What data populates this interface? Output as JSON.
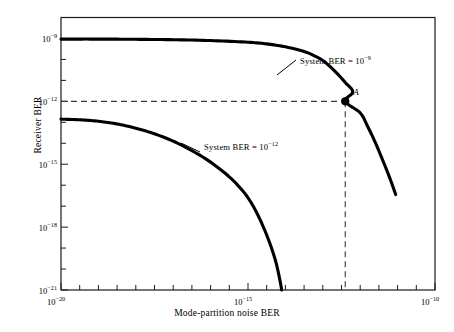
{
  "chart_data": {
    "type": "line",
    "title": "",
    "xlabel": "Mode-partition noise BER",
    "ylabel": "Receiver BER",
    "xscale": "log",
    "yscale": "log",
    "xlim": [
      1e-20,
      1e-10
    ],
    "ylim": [
      1e-21,
      1e-08
    ],
    "xticks": [
      "10^-20",
      "10^-15",
      "10^-10"
    ],
    "xtick_labels": [
      "10⁻²⁰",
      "10⁻¹⁵",
      "10⁻¹⁰"
    ],
    "xtick_values": [
      -20,
      -15,
      -10
    ],
    "yticks": [
      "10^-9",
      "10^-12",
      "10^-15",
      "10^-18",
      "10^-21"
    ],
    "ytick_labels": [
      "10⁻⁹",
      "10⁻¹²",
      "10⁻¹⁵",
      "10⁻¹⁸",
      "10⁻²¹"
    ],
    "ytick_values": [
      -9,
      -12,
      -15,
      -18,
      -21
    ],
    "grid": false,
    "legend": "none",
    "series": [
      {
        "name": "System BER = 10^-9",
        "label_text": "System BER  =  10",
        "label_exp": "−9",
        "style": "solid-thick",
        "points_log": [
          [
            -20.0,
            -9.03
          ],
          [
            -19.0,
            -9.03
          ],
          [
            -18.0,
            -9.04
          ],
          [
            -17.0,
            -9.06
          ],
          [
            -16.0,
            -9.1
          ],
          [
            -15.0,
            -9.18
          ],
          [
            -14.5,
            -9.26
          ],
          [
            -14.0,
            -9.4
          ],
          [
            -13.5,
            -9.62
          ],
          [
            -13.2,
            -9.85
          ],
          [
            -13.0,
            -10.05
          ],
          [
            -12.8,
            -10.35
          ],
          [
            -12.6,
            -10.7
          ],
          [
            -12.4,
            -11.1
          ],
          [
            -12.2,
            -11.55
          ],
          [
            -12.4,
            -12.0
          ],
          [
            -12.0,
            -12.55
          ],
          [
            -11.8,
            -13.2
          ],
          [
            -11.6,
            -13.95
          ],
          [
            -11.4,
            -14.8
          ],
          [
            -11.2,
            -15.7
          ],
          [
            -11.05,
            -16.45
          ]
        ]
      },
      {
        "name": "System BER = 10^-12",
        "label_text": "System BER  =  10",
        "label_exp": "−12",
        "style": "solid-thick",
        "points_log": [
          [
            -20.0,
            -12.85
          ],
          [
            -19.5,
            -12.88
          ],
          [
            -19.0,
            -12.95
          ],
          [
            -18.5,
            -13.08
          ],
          [
            -18.0,
            -13.28
          ],
          [
            -17.5,
            -13.55
          ],
          [
            -17.0,
            -13.9
          ],
          [
            -16.5,
            -14.35
          ],
          [
            -16.0,
            -14.9
          ],
          [
            -15.5,
            -15.6
          ],
          [
            -15.2,
            -16.15
          ],
          [
            -15.0,
            -16.6
          ],
          [
            -14.8,
            -17.2
          ],
          [
            -14.6,
            -17.95
          ],
          [
            -14.4,
            -18.85
          ],
          [
            -14.25,
            -19.7
          ],
          [
            -14.15,
            -20.5
          ],
          [
            -14.1,
            -21.0
          ]
        ]
      }
    ],
    "annotations": [
      {
        "name": "point-a",
        "label": "A",
        "x_log": -12.4,
        "y_log": -12.0,
        "marker": "filled-circle",
        "guide_lines": "dashed horizontal to y-axis, dashed vertical to x-axis"
      }
    ]
  },
  "axis": {
    "xlabel": "Mode-partition noise BER",
    "ylabel": "Receiver BER"
  },
  "xticklabels": [
    {
      "mant": "10",
      "exp": "−20"
    },
    {
      "mant": "10",
      "exp": "−15"
    },
    {
      "mant": "10",
      "exp": "−10"
    }
  ],
  "yticklabels": [
    {
      "mant": "10",
      "exp": "−9"
    },
    {
      "mant": "10",
      "exp": "−12"
    },
    {
      "mant": "10",
      "exp": "−15"
    },
    {
      "mant": "10",
      "exp": "−18"
    },
    {
      "mant": "10",
      "exp": "−21"
    }
  ],
  "annotations": {
    "upper_curve": {
      "text": "System BER  =  10",
      "exp": "−9"
    },
    "lower_curve": {
      "text": "System BER  =  10",
      "exp": "−12"
    },
    "point_a": "A"
  },
  "colors": {
    "curve": "#000000",
    "frame": "#1a1a1a",
    "dashed": "#3a3a3a",
    "background": "#ffffff"
  }
}
